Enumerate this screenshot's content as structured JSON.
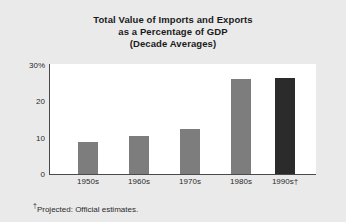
{
  "chart_data": {
    "type": "bar",
    "title": "Total Value of Imports and Exports as a Percentage of GDP (Decade Averages)",
    "title_lines": [
      "Total Value of Imports and Exports",
      "as a Percentage of GDP",
      "(Decade Averages)"
    ],
    "categories": [
      "1950s",
      "1960s",
      "1970s",
      "1980s",
      "1990s†"
    ],
    "values": [
      8.6,
      10.5,
      12.2,
      25.8,
      26.1
    ],
    "xlabel": "",
    "ylabel": "",
    "ylim": [
      0,
      30
    ],
    "ytick_labels": [
      "0",
      "10",
      "20",
      "30%"
    ],
    "ytick_values": [
      0,
      10,
      20,
      30
    ],
    "grid": false,
    "legend": null,
    "bar_colors": [
      "#7d7d7d",
      "#7d7d7d",
      "#7d7d7d",
      "#7d7d7d",
      "#2b2b2b"
    ],
    "annotations": [
      "†Projected: Official estimates."
    ]
  },
  "footnote": {
    "dagger": "†",
    "text": "Projected: Official estimates."
  },
  "colors": {
    "background": "#eaeaea",
    "plot_background": "#ffffff",
    "axis": "#4a4a4a",
    "bar": "#7d7d7d",
    "bar_highlight": "#2b2b2b",
    "text": "#2b2b2b"
  }
}
